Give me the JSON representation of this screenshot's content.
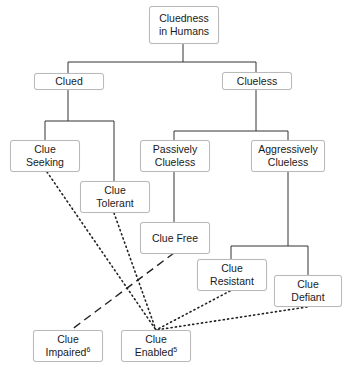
{
  "diagram": {
    "type": "hierarchy",
    "nodes": {
      "root": {
        "lines": [
          "Cluedness",
          "in Humans"
        ]
      },
      "clued": {
        "lines": [
          "Clued"
        ]
      },
      "clueless": {
        "lines": [
          "Clueless"
        ]
      },
      "clue_seeking": {
        "lines": [
          "Clue",
          "Seeking"
        ]
      },
      "clue_tolerant": {
        "lines": [
          "Clue",
          "Tolerant"
        ]
      },
      "passively_clueless": {
        "lines": [
          "Passively",
          "Clueless"
        ]
      },
      "aggressively_clueless": {
        "lines": [
          "Aggressively",
          "Clueless"
        ]
      },
      "clue_free": {
        "lines": [
          "Clue Free"
        ]
      },
      "clue_resistant": {
        "lines": [
          "Clue",
          "Resistant"
        ]
      },
      "clue_defiant": {
        "lines": [
          "Clue",
          "Defiant"
        ]
      },
      "clue_impaired": {
        "lines": [
          "Clue",
          "Impaired"
        ],
        "superscript": "6"
      },
      "clue_enabled": {
        "lines": [
          "Clue",
          "Enabled"
        ],
        "superscript": "5"
      }
    },
    "edges": {
      "solid": [
        [
          "root",
          "clued"
        ],
        [
          "root",
          "clueless"
        ],
        [
          "clued",
          "clue_seeking"
        ],
        [
          "clued",
          "clue_tolerant"
        ],
        [
          "clueless",
          "passively_clueless"
        ],
        [
          "clueless",
          "aggressively_clueless"
        ],
        [
          "passively_clueless",
          "clue_free"
        ],
        [
          "aggressively_clueless",
          "clue_resistant"
        ],
        [
          "aggressively_clueless",
          "clue_defiant"
        ]
      ],
      "dotted": [
        [
          "clue_seeking",
          "clue_enabled"
        ],
        [
          "clue_tolerant",
          "clue_enabled"
        ],
        [
          "clue_resistant",
          "clue_enabled"
        ],
        [
          "clue_defiant",
          "clue_enabled"
        ]
      ],
      "dashed": [
        [
          "clue_free",
          "clue_impaired"
        ]
      ]
    }
  }
}
